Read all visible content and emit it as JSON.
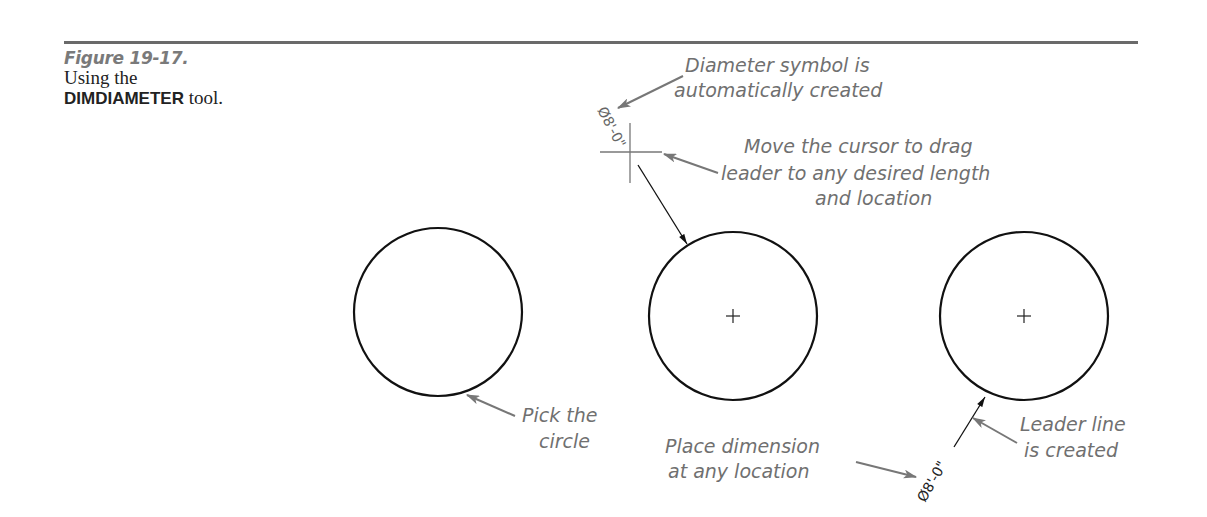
{
  "figure": {
    "number": "Figure 19-17.",
    "caption_line1": "Using the",
    "caption_command": "DIMDIAMETER",
    "caption_tail": " tool."
  },
  "callouts": {
    "diameter_symbol": [
      "Diameter symbol is",
      "automatically created"
    ],
    "move_cursor": [
      "Move the cursor to drag",
      "leader to any desired length",
      "and location"
    ],
    "pick_circle": [
      "Pick the",
      "circle"
    ],
    "place_dimension": [
      "Place dimension",
      "at any location"
    ],
    "leader_line": [
      "Leader line",
      "is created"
    ]
  },
  "dimensions": {
    "dragging_value": "Ø8'-0\"",
    "placed_value": "Ø8'-0\""
  },
  "colors": {
    "rule": "#6a6a6a",
    "callout_text": "#707070",
    "callout_arrow": "#777777",
    "geometry": "#111111"
  }
}
